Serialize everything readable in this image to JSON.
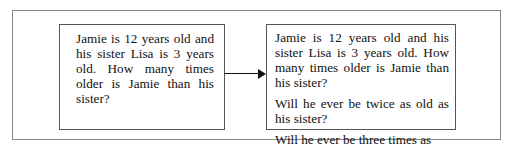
{
  "diagram": {
    "left_box": {
      "text": "Jamie is 12 years old and his sister Lisa is 3 years old. How many times older is Jamie than his sister?"
    },
    "arrow": {
      "direction": "right"
    },
    "right_box": {
      "paragraphs": [
        "Jamie is 12 years old and his sister Lisa is 3 years old.  How many times older is Jamie than his sister?",
        "Will he ever be twice as old as his sister?",
        "Will he ever be three times as old?"
      ]
    }
  }
}
